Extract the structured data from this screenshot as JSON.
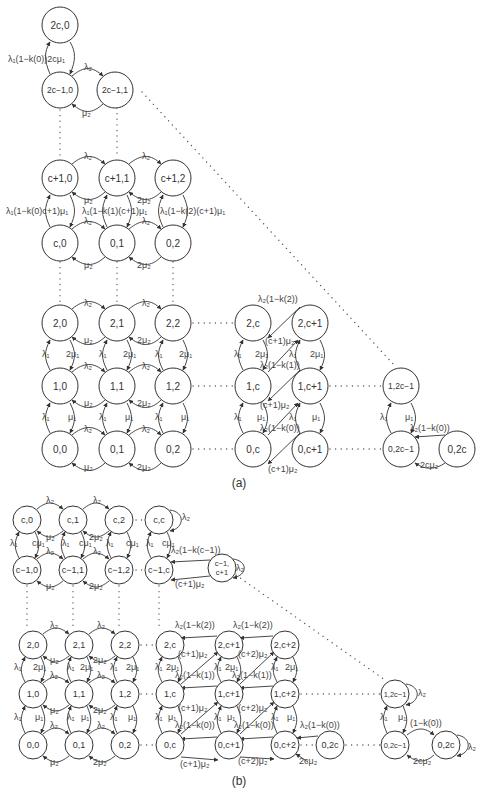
{
  "figure": {
    "caption_a": "(a)",
    "caption_b": "(b)"
  },
  "diagram_a": {
    "node_radius": 18,
    "nodes": [
      {
        "id": "a_2c_0",
        "label": "2c,0",
        "x": 60,
        "y": 25
      },
      {
        "id": "a_2cm1_0",
        "label": "2c−1,0",
        "x": 60,
        "y": 90
      },
      {
        "id": "a_2cm1_1",
        "label": "2c−1,1",
        "x": 115,
        "y": 90
      },
      {
        "id": "a_cp1_0",
        "label": "c+1,0",
        "x": 60,
        "y": 178
      },
      {
        "id": "a_cp1_1",
        "label": "c+1,1",
        "x": 117,
        "y": 178
      },
      {
        "id": "a_cp1_2",
        "label": "c+1,2",
        "x": 173,
        "y": 178
      },
      {
        "id": "a_c_0",
        "label": "c,0",
        "x": 60,
        "y": 243
      },
      {
        "id": "a_0_1top",
        "label": "0,1",
        "x": 117,
        "y": 243
      },
      {
        "id": "a_0_2top",
        "label": "0,2",
        "x": 173,
        "y": 243
      },
      {
        "id": "a_2_0",
        "label": "2,0",
        "x": 60,
        "y": 323
      },
      {
        "id": "a_2_1",
        "label": "2,1",
        "x": 117,
        "y": 323
      },
      {
        "id": "a_2_2",
        "label": "2,2",
        "x": 173,
        "y": 323
      },
      {
        "id": "a_1_0",
        "label": "1,0",
        "x": 60,
        "y": 386
      },
      {
        "id": "a_1_1",
        "label": "1,1",
        "x": 117,
        "y": 386
      },
      {
        "id": "a_1_2",
        "label": "1,2",
        "x": 173,
        "y": 386
      },
      {
        "id": "a_0_0",
        "label": "0,0",
        "x": 60,
        "y": 449
      },
      {
        "id": "a_0_1",
        "label": "0,1",
        "x": 117,
        "y": 449
      },
      {
        "id": "a_0_2",
        "label": "0,2",
        "x": 173,
        "y": 449
      },
      {
        "id": "a_2_c",
        "label": "2,c",
        "x": 253,
        "y": 323
      },
      {
        "id": "a_2_cp1",
        "label": "2,c+1",
        "x": 310,
        "y": 323
      },
      {
        "id": "a_1_c",
        "label": "1,c",
        "x": 253,
        "y": 386
      },
      {
        "id": "a_1_cp1",
        "label": "1,c+1",
        "x": 310,
        "y": 386
      },
      {
        "id": "a_0_c",
        "label": "0,c",
        "x": 253,
        "y": 449
      },
      {
        "id": "a_0_cp1",
        "label": "0,c+1",
        "x": 310,
        "y": 449
      },
      {
        "id": "a_1_2cm1",
        "label": "1,2c−1",
        "x": 401,
        "y": 386
      },
      {
        "id": "a_0_2cm1",
        "label": "0,2c−1",
        "x": 401,
        "y": 449
      },
      {
        "id": "a_0_2c",
        "label": "0,2c",
        "x": 457,
        "y": 449
      }
    ],
    "edge_labels": [
      {
        "text": "λ₁(1−k(0))2cμ₁",
        "x": 8,
        "y": 62
      },
      {
        "text": "λ₂",
        "x": 84,
        "y": 70
      },
      {
        "text": "μ₂",
        "x": 82,
        "y": 116
      },
      {
        "text": "λ₂",
        "x": 84,
        "y": 159
      },
      {
        "text": "λ₂",
        "x": 142,
        "y": 159
      },
      {
        "text": "μ₂",
        "x": 84,
        "y": 203
      },
      {
        "text": "2μ₂",
        "x": 137,
        "y": 203
      },
      {
        "text": "λ₁(1−k(0)c+1)μ₁",
        "x": 6,
        "y": 214
      },
      {
        "text": "λ₁(1−k(1)(c+1)μ₁",
        "x": 82,
        "y": 214
      },
      {
        "text": "λ₁(1−k(2)(c+1)μ₁",
        "x": 160,
        "y": 214
      },
      {
        "text": "λ₂",
        "x": 84,
        "y": 224
      },
      {
        "text": "λ₂",
        "x": 142,
        "y": 224
      },
      {
        "text": "μ₂",
        "x": 84,
        "y": 268
      },
      {
        "text": "2μ₂",
        "x": 137,
        "y": 268
      },
      {
        "text": "λ₂",
        "x": 84,
        "y": 306
      },
      {
        "text": "λ₂",
        "x": 142,
        "y": 306
      },
      {
        "text": "μ₂",
        "x": 84,
        "y": 343
      },
      {
        "text": "2μ₂",
        "x": 137,
        "y": 343
      },
      {
        "text": "λ₁",
        "x": 42,
        "y": 357
      },
      {
        "text": "2μ₁",
        "x": 66,
        "y": 357
      },
      {
        "text": "λ₁",
        "x": 99,
        "y": 357
      },
      {
        "text": "2μ₁",
        "x": 123,
        "y": 357
      },
      {
        "text": "λ₁",
        "x": 155,
        "y": 357
      },
      {
        "text": "2μ₁",
        "x": 179,
        "y": 357
      },
      {
        "text": "λ₂",
        "x": 84,
        "y": 369
      },
      {
        "text": "λ₂",
        "x": 142,
        "y": 369
      },
      {
        "text": "μ₂",
        "x": 84,
        "y": 406
      },
      {
        "text": "2μ₂",
        "x": 137,
        "y": 406
      },
      {
        "text": "λ₁",
        "x": 42,
        "y": 420
      },
      {
        "text": "μ₁",
        "x": 68,
        "y": 420
      },
      {
        "text": "λ₁",
        "x": 99,
        "y": 420
      },
      {
        "text": "μ₁",
        "x": 125,
        "y": 420
      },
      {
        "text": "λ₁",
        "x": 155,
        "y": 420
      },
      {
        "text": "μ₁",
        "x": 181,
        "y": 420
      },
      {
        "text": "λ₂",
        "x": 84,
        "y": 432
      },
      {
        "text": "λ₂",
        "x": 142,
        "y": 432
      },
      {
        "text": "μ₂",
        "x": 84,
        "y": 470
      },
      {
        "text": "2μ₂",
        "x": 137,
        "y": 470
      },
      {
        "text": "λ₂(1−k(2))",
        "x": 258,
        "y": 302
      },
      {
        "text": "(c+1)μ₂",
        "x": 265,
        "y": 344
      },
      {
        "text": "λ₁",
        "x": 234,
        "y": 357
      },
      {
        "text": "2μ₁",
        "x": 255,
        "y": 357
      },
      {
        "text": "λ₁",
        "x": 289,
        "y": 357
      },
      {
        "text": "2μ₁",
        "x": 310,
        "y": 357
      },
      {
        "text": "λ₂(1−k(1))",
        "x": 260,
        "y": 368
      },
      {
        "text": "(c+1)μ₂",
        "x": 260,
        "y": 408
      },
      {
        "text": "λ₁",
        "x": 234,
        "y": 420
      },
      {
        "text": "μ₁",
        "x": 257,
        "y": 420
      },
      {
        "text": "λ₁",
        "x": 289,
        "y": 420
      },
      {
        "text": "μ₁",
        "x": 312,
        "y": 420
      },
      {
        "text": "λ₂(1−k(0))",
        "x": 260,
        "y": 431
      },
      {
        "text": "(c+1)μ₂",
        "x": 268,
        "y": 472
      },
      {
        "text": "λ₁",
        "x": 380,
        "y": 420
      },
      {
        "text": "μ₁",
        "x": 405,
        "y": 420
      },
      {
        "text": "λ₂(1−k(0))",
        "x": 410,
        "y": 431
      },
      {
        "text": "2cμ₂",
        "x": 420,
        "y": 468
      }
    ]
  },
  "diagram_b": {
    "node_radius": 14,
    "nodes": [
      {
        "id": "b_c_0",
        "label": "c,0",
        "x": 27,
        "y": 520
      },
      {
        "id": "b_c_1",
        "label": "c,1",
        "x": 73,
        "y": 520
      },
      {
        "id": "b_c_2",
        "label": "c,2",
        "x": 119,
        "y": 520
      },
      {
        "id": "b_c_c",
        "label": "c,c",
        "x": 159,
        "y": 520
      },
      {
        "id": "b_cm1_0",
        "label": "c−1,0",
        "x": 27,
        "y": 570
      },
      {
        "id": "b_cm1_1",
        "label": "c−1,1",
        "x": 73,
        "y": 570
      },
      {
        "id": "b_cm1_2",
        "label": "c−1,2",
        "x": 119,
        "y": 570
      },
      {
        "id": "b_cm1_c",
        "label": "c−1,c",
        "x": 159,
        "y": 570
      },
      {
        "id": "b_cm1_cp1",
        "label": "c−1,\nc+1",
        "x": 222,
        "y": 568
      },
      {
        "id": "b_2_0",
        "label": "2,0",
        "x": 33,
        "y": 645
      },
      {
        "id": "b_2_1",
        "label": "2,1",
        "x": 79,
        "y": 645
      },
      {
        "id": "b_2_2",
        "label": "2,2",
        "x": 125,
        "y": 645
      },
      {
        "id": "b_2_c",
        "label": "2,c",
        "x": 170,
        "y": 645
      },
      {
        "id": "b_2_cp1",
        "label": "2,c+1",
        "x": 229,
        "y": 645
      },
      {
        "id": "b_2_cp2",
        "label": "2,c+2",
        "x": 285,
        "y": 645
      },
      {
        "id": "b_1_0",
        "label": "1,0",
        "x": 33,
        "y": 694
      },
      {
        "id": "b_1_1",
        "label": "1,1",
        "x": 79,
        "y": 694
      },
      {
        "id": "b_1_2",
        "label": "1,2",
        "x": 125,
        "y": 694
      },
      {
        "id": "b_1_c",
        "label": "1,c",
        "x": 170,
        "y": 694
      },
      {
        "id": "b_1_cp1",
        "label": "1,c+1",
        "x": 229,
        "y": 694
      },
      {
        "id": "b_1_cp2",
        "label": "1,c+2",
        "x": 285,
        "y": 694
      },
      {
        "id": "b_0_0",
        "label": "0,0",
        "x": 33,
        "y": 745
      },
      {
        "id": "b_0_1",
        "label": "0,1",
        "x": 79,
        "y": 745
      },
      {
        "id": "b_0_2",
        "label": "0,2",
        "x": 125,
        "y": 745
      },
      {
        "id": "b_0_c",
        "label": "0,c",
        "x": 170,
        "y": 745
      },
      {
        "id": "b_0_cp1",
        "label": "0,c+1",
        "x": 229,
        "y": 745
      },
      {
        "id": "b_0_cp2",
        "label": "0,c+2",
        "x": 285,
        "y": 745
      },
      {
        "id": "b_0_2c_mid",
        "label": "0,2c",
        "x": 330,
        "y": 745
      },
      {
        "id": "b_1_2cm1",
        "label": "1,2c−1",
        "x": 395,
        "y": 694
      },
      {
        "id": "b_0_2cm1",
        "label": "0,2c−1",
        "x": 395,
        "y": 745
      },
      {
        "id": "b_0_2c",
        "label": "0,2c",
        "x": 446,
        "y": 745
      }
    ],
    "edge_labels": [
      {
        "text": "λ₂",
        "x": 46,
        "y": 503
      },
      {
        "text": "λ₂",
        "x": 93,
        "y": 503
      },
      {
        "text": "λ₂",
        "x": 182,
        "y": 520
      },
      {
        "text": "μ₂",
        "x": 46,
        "y": 540
      },
      {
        "text": "2μ₂",
        "x": 89,
        "y": 540
      },
      {
        "text": "λ₁",
        "x": 10,
        "y": 546
      },
      {
        "text": "cμ₁",
        "x": 32,
        "y": 546
      },
      {
        "text": "λ₁",
        "x": 62,
        "y": 546
      },
      {
        "text": "cμ₁",
        "x": 79,
        "y": 546
      },
      {
        "text": "λ₁",
        "x": 106,
        "y": 546
      },
      {
        "text": "cμ₁",
        "x": 126,
        "y": 546
      },
      {
        "text": "λ₁",
        "x": 146,
        "y": 546
      },
      {
        "text": "cμ₁",
        "x": 162,
        "y": 546
      },
      {
        "text": "λ₂(1−k(c−1))",
        "x": 171,
        "y": 553
      },
      {
        "text": "λ₂",
        "x": 46,
        "y": 554
      },
      {
        "text": "λ₂",
        "x": 93,
        "y": 554
      },
      {
        "text": "λ₂",
        "x": 236,
        "y": 571
      },
      {
        "text": "μ₂",
        "x": 46,
        "y": 589
      },
      {
        "text": "2μ₂",
        "x": 89,
        "y": 589
      },
      {
        "text": "(c+1)μ₂",
        "x": 175,
        "y": 587
      },
      {
        "text": "λ₂",
        "x": 50,
        "y": 628
      },
      {
        "text": "λ₂",
        "x": 97,
        "y": 628
      },
      {
        "text": "λ₂(1−k(2))",
        "x": 175,
        "y": 628
      },
      {
        "text": "λ₂(1−k(2))",
        "x": 233,
        "y": 628
      },
      {
        "text": "μ₂",
        "x": 50,
        "y": 663
      },
      {
        "text": "2μ₂",
        "x": 93,
        "y": 663
      },
      {
        "text": "(c+1)μ₂",
        "x": 178,
        "y": 657
      },
      {
        "text": "(c+2)μ₂",
        "x": 238,
        "y": 657
      },
      {
        "text": "λ₁",
        "x": 14,
        "y": 670
      },
      {
        "text": "2μ₁",
        "x": 33,
        "y": 670
      },
      {
        "text": "λ₁",
        "x": 67,
        "y": 670
      },
      {
        "text": "2μ₁",
        "x": 80,
        "y": 670
      },
      {
        "text": "λ₁",
        "x": 110,
        "y": 670
      },
      {
        "text": "2μ₁",
        "x": 126,
        "y": 670
      },
      {
        "text": "λ₁",
        "x": 155,
        "y": 670
      },
      {
        "text": "2μ₁",
        "x": 166,
        "y": 670
      },
      {
        "text": "λ₁",
        "x": 214,
        "y": 670
      },
      {
        "text": "2μ₁",
        "x": 225,
        "y": 670
      },
      {
        "text": "λ₁",
        "x": 271,
        "y": 670
      },
      {
        "text": "2μ₁",
        "x": 285,
        "y": 670
      },
      {
        "text": "λ₂(1−k(1))",
        "x": 175,
        "y": 678
      },
      {
        "text": "λ₂(1−k(1))",
        "x": 232,
        "y": 678
      },
      {
        "text": "λ₂",
        "x": 50,
        "y": 678
      },
      {
        "text": "λ₂",
        "x": 97,
        "y": 678
      },
      {
        "text": "μ₂",
        "x": 50,
        "y": 713
      },
      {
        "text": "2μ₂",
        "x": 93,
        "y": 713
      },
      {
        "text": "(c+1)μ₂",
        "x": 178,
        "y": 711
      },
      {
        "text": "(c+2)μ₂",
        "x": 238,
        "y": 711
      },
      {
        "text": "λ₁",
        "x": 14,
        "y": 720
      },
      {
        "text": "μ₁",
        "x": 35,
        "y": 720
      },
      {
        "text": "λ₁",
        "x": 67,
        "y": 720
      },
      {
        "text": "μ₁",
        "x": 81,
        "y": 720
      },
      {
        "text": "λ₁",
        "x": 110,
        "y": 720
      },
      {
        "text": "μ₁",
        "x": 128,
        "y": 720
      },
      {
        "text": "λ₁",
        "x": 155,
        "y": 720
      },
      {
        "text": "μ₁",
        "x": 168,
        "y": 720
      },
      {
        "text": "λ₁",
        "x": 214,
        "y": 720
      },
      {
        "text": "μ₁",
        "x": 227,
        "y": 720
      },
      {
        "text": "λ₁",
        "x": 271,
        "y": 720
      },
      {
        "text": "μ₁",
        "x": 287,
        "y": 720
      },
      {
        "text": "λ₂(1−k(0))",
        "x": 175,
        "y": 728
      },
      {
        "text": "λ₂(1−k(0))",
        "x": 234,
        "y": 728
      },
      {
        "text": "λ₂(1−k(0))",
        "x": 300,
        "y": 728
      },
      {
        "text": "λ₂",
        "x": 50,
        "y": 728
      },
      {
        "text": "λ₂",
        "x": 97,
        "y": 728
      },
      {
        "text": "μ₂",
        "x": 50,
        "y": 765
      },
      {
        "text": "2μ₂",
        "x": 93,
        "y": 765
      },
      {
        "text": "(c+1)μ₂",
        "x": 180,
        "y": 767
      },
      {
        "text": "(c+2)μ₂",
        "x": 238,
        "y": 764
      },
      {
        "text": "2cμ₂",
        "x": 299,
        "y": 764
      },
      {
        "text": "λ₂",
        "x": 418,
        "y": 696
      },
      {
        "text": "λ₁",
        "x": 380,
        "y": 720
      },
      {
        "text": "μ₁",
        "x": 398,
        "y": 720
      },
      {
        "text": "(1−k(0))",
        "x": 410,
        "y": 726
      },
      {
        "text": "2cμ₂",
        "x": 413,
        "y": 764
      },
      {
        "text": "λ₂",
        "x": 468,
        "y": 750
      }
    ]
  }
}
